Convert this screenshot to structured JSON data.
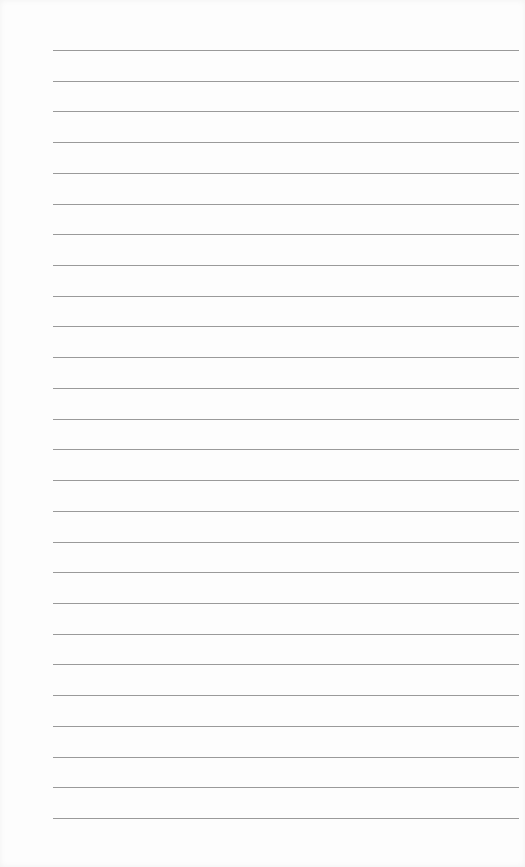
{
  "page": {
    "type": "lined-paper",
    "background_color": "#fdfdfd",
    "line_color": "#9a9a9a",
    "line_count": 26,
    "first_line_y": 50,
    "line_spacing": 30.72,
    "line_left": 53,
    "line_right": 519
  }
}
